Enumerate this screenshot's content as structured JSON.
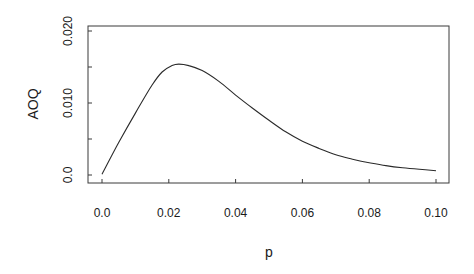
{
  "chart_data": {
    "type": "line",
    "title": "",
    "xlabel": "p",
    "ylabel": "AOQ",
    "xlim": [
      0.0,
      0.1
    ],
    "ylim": [
      0.0,
      0.02
    ],
    "grid": false,
    "legend": null,
    "x_ticks": [
      0.0,
      0.02,
      0.04,
      0.06,
      0.08,
      0.1
    ],
    "x_tick_labels": [
      "0.0",
      "0.02",
      "0.04",
      "0.06",
      "0.08",
      "0.10"
    ],
    "y_ticks": [
      0.0,
      0.005,
      0.01,
      0.015,
      0.02
    ],
    "y_tick_labels": [
      "0.0",
      "",
      "0.010",
      "",
      "0.020"
    ],
    "series": [
      {
        "name": "AOQ curve",
        "x": [
          0.0,
          0.005,
          0.01,
          0.015,
          0.018,
          0.021,
          0.023,
          0.026,
          0.03,
          0.035,
          0.04,
          0.045,
          0.05,
          0.055,
          0.06,
          0.065,
          0.07,
          0.075,
          0.08,
          0.085,
          0.09,
          0.095,
          0.1
        ],
        "values": [
          0.0001,
          0.0045,
          0.0086,
          0.0125,
          0.0143,
          0.0152,
          0.0154,
          0.0152,
          0.0145,
          0.013,
          0.0111,
          0.0093,
          0.0076,
          0.006,
          0.0047,
          0.0037,
          0.0028,
          0.0022,
          0.0017,
          0.0013,
          0.001,
          0.0008,
          0.0006
        ]
      }
    ]
  },
  "axes": {
    "x_label": "p",
    "y_label": "AOQ",
    "x_tick_labels": [
      "0.0",
      "0.02",
      "0.04",
      "0.06",
      "0.08",
      "0.10"
    ],
    "y_tick_labels": [
      "0.0",
      "0.010",
      "0.020"
    ]
  }
}
